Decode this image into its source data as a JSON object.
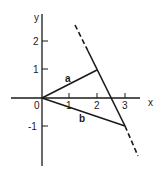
{
  "diagram": {
    "type": "vector-plot",
    "axes": {
      "x_label": "x",
      "y_label": "y",
      "origin_label": "0",
      "x_ticks": [
        "1",
        "2",
        "3"
      ],
      "y_ticks": [
        "2",
        "1",
        "-1"
      ]
    },
    "vectors": [
      {
        "name": "a",
        "label": "a",
        "from": [
          0,
          0
        ],
        "to": [
          2,
          1
        ]
      },
      {
        "name": "b",
        "label": "b",
        "from": [
          0,
          0
        ],
        "to": [
          3,
          -1
        ]
      }
    ],
    "line": {
      "style": "dashed-extended",
      "through": [
        [
          2,
          1
        ],
        [
          3,
          -1
        ]
      ],
      "solid_segment": [
        [
          2,
          1
        ],
        [
          3,
          -1
        ]
      ]
    },
    "colors": {
      "stroke": "#1a1a1a",
      "background": "#ffffff"
    }
  }
}
